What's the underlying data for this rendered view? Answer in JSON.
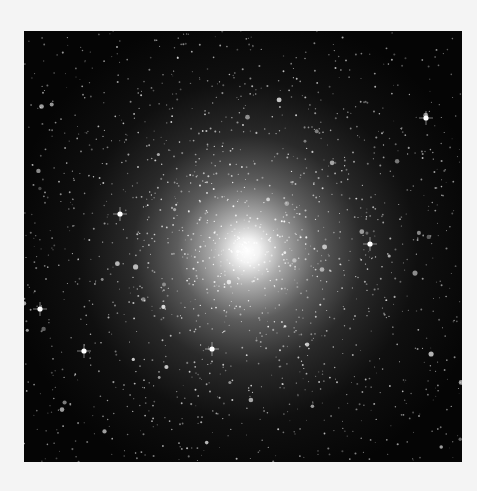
{
  "image": {
    "subject": "globular star cluster",
    "alt": "Dense globular star cluster with a bright white core against a black starfield",
    "colors": {
      "background": "#f4f4f4",
      "sky": "#050505",
      "core": "#ffffff"
    }
  }
}
